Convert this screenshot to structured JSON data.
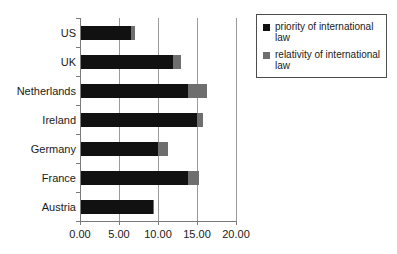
{
  "chart_data": {
    "type": "bar",
    "orientation": "horizontal",
    "stacked": true,
    "title": "",
    "xlabel": "",
    "ylabel": "",
    "xlim": [
      0,
      20
    ],
    "grid": true,
    "legend_position": "right",
    "categories": [
      "US",
      "UK",
      "Netherlands",
      "Ireland",
      "Germany",
      "France",
      "Austria"
    ],
    "xticks": [
      "0.00",
      "5.00",
      "10.00",
      "15.00",
      "20.00"
    ],
    "xtick_values": [
      0,
      5,
      10,
      15,
      20
    ],
    "series": [
      {
        "name": "priority of international law",
        "color": "#111111",
        "values": [
          6.6,
          11.9,
          13.8,
          15.0,
          10.0,
          13.9,
          9.4
        ]
      },
      {
        "name": "relativity of international law",
        "color": "#6e6e6e",
        "values": [
          0.5,
          1.0,
          2.5,
          0.8,
          1.3,
          1.3,
          0.1
        ]
      }
    ],
    "totals": [
      7.1,
      12.9,
      16.3,
      15.8,
      11.3,
      15.2,
      9.5
    ]
  },
  "legend": {
    "entries": [
      {
        "label": "priority of international law"
      },
      {
        "label": "relativity of international law"
      }
    ]
  },
  "axis": {
    "line_color": "#7a7a7a",
    "grid_color": "#9a9a9a"
  }
}
